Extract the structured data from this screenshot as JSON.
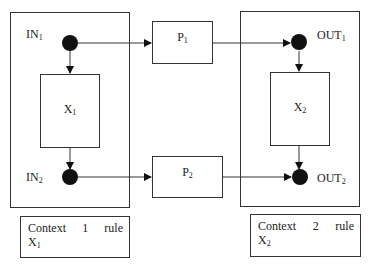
{
  "diagram": {
    "context1": {
      "container_label": "Context 1 rule",
      "rule_words": [
        "Context",
        "1",
        "rule"
      ],
      "rule_var": "X",
      "rule_var_sub": "1",
      "process": {
        "name": "X",
        "sub": "1"
      },
      "input_top": {
        "name": "IN",
        "sub": "1"
      },
      "input_bottom": {
        "name": "IN",
        "sub": "2"
      }
    },
    "context2": {
      "container_label": "Context 2 rule",
      "rule_words": [
        "Context",
        "2",
        "rule"
      ],
      "rule_var": "X",
      "rule_var_sub": "2",
      "process": {
        "name": "X",
        "sub": "2"
      },
      "output_top": {
        "name": "OUT",
        "sub": "1"
      },
      "output_bottom": {
        "name": "OUT",
        "sub": "2"
      }
    },
    "channels": [
      {
        "name": "P",
        "sub": "1"
      },
      {
        "name": "P",
        "sub": "2"
      }
    ],
    "colors": {
      "stroke": "#333333",
      "node_fill": "#111111",
      "background": "#ffffff"
    }
  }
}
